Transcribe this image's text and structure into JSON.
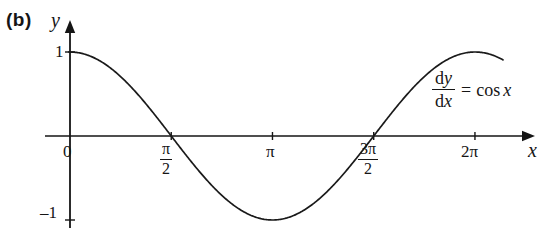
{
  "figure": {
    "part_label": "(b)",
    "background": "#ffffff",
    "ink_color": "#151515",
    "curve_color": "#1a1a1a"
  },
  "annotation": {
    "equation": "dy/dx = cos x",
    "numerator_d": "d",
    "numerator_var": "y",
    "denominator_d": "d",
    "denominator_var": "x",
    "equals": "=",
    "rhs_function": "cos",
    "rhs_var": "x"
  },
  "axes": {
    "x_label": "x",
    "y_label": "y",
    "x_ticks": [
      {
        "label": "0",
        "value": 0
      },
      {
        "label": "π/2",
        "num": "π",
        "den": "2",
        "value": 1.5707963
      },
      {
        "label": "π",
        "value": 3.1415927
      },
      {
        "label": "3π/2",
        "num": "3π",
        "den": "2",
        "value": 4.712389
      },
      {
        "label": "2π",
        "value": 6.2831853
      }
    ],
    "y_ticks": [
      {
        "label": "1",
        "value": 1
      },
      {
        "label": "–1",
        "value": -1
      }
    ],
    "xlim": [
      -0.39,
      7.22
    ],
    "ylim": [
      -1.45,
      1.6
    ]
  },
  "chart_data": {
    "type": "line",
    "title": "",
    "xlabel": "x",
    "ylabel": "y",
    "function": "y = cos x",
    "grid": false,
    "legend": false,
    "xlim": [
      0,
      6.2831853
    ],
    "ylim": [
      -1,
      1
    ],
    "x": [
      0.0,
      0.3141593,
      0.6283185,
      0.9424778,
      1.2566371,
      1.5707963,
      1.8849556,
      2.1991149,
      2.5132741,
      2.8274334,
      3.1415927,
      3.4557519,
      3.7699112,
      4.0840704,
      4.3982297,
      4.712389,
      5.0265482,
      5.3407075,
      5.6548668,
      5.969026,
      6.2831853
    ],
    "y": [
      1.0,
      0.9510565,
      0.809017,
      0.5877853,
      0.309017,
      0.0,
      -0.309017,
      -0.5877853,
      -0.809017,
      -0.9510565,
      -1.0,
      -0.9510565,
      -0.809017,
      -0.5877853,
      -0.309017,
      0.0,
      0.309017,
      0.5877853,
      0.809017,
      0.9510565,
      1.0
    ],
    "x_tick_values": [
      0,
      1.5707963,
      3.1415927,
      4.712389,
      6.2831853
    ],
    "x_tick_labels": [
      "0",
      "π/2",
      "π",
      "3π/2",
      "2π"
    ],
    "y_tick_values": [
      1,
      -1
    ],
    "y_tick_labels": [
      "1",
      "–1"
    ],
    "zero_crossings": [
      1.5707963,
      4.712389
    ],
    "maxima": [
      {
        "x": 0,
        "y": 1
      },
      {
        "x": 6.2831853,
        "y": 1
      }
    ],
    "minima": [
      {
        "x": 3.1415927,
        "y": -1
      }
    ],
    "annotations": [
      "dy/dx = cos x"
    ]
  },
  "geometry": {
    "origin_px": {
      "x": 70,
      "y": 136
    },
    "x_unit_px": 64.45,
    "y_unit_px": 84,
    "x_axis_start_px": 45,
    "x_axis_end_px": 535,
    "y_axis_top_px": 20,
    "y_axis_bottom_px": 228,
    "curve_start_x": -0.02,
    "curve_end_x": 6.72
  }
}
